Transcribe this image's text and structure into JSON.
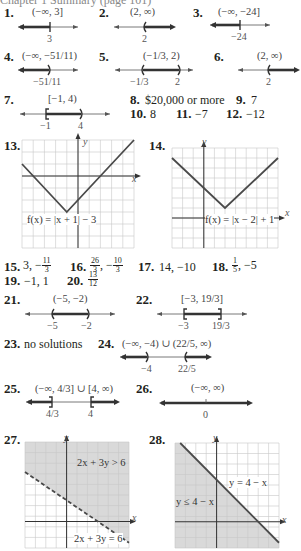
{
  "header": {
    "partial_text": "Chapter 1 Summary (page 101)"
  },
  "problems": [
    {
      "num": "1.",
      "interval": "(−∞, 3]",
      "points": [
        "3"
      ]
    },
    {
      "num": "2.",
      "interval": "(2, ∞)",
      "points": [
        "2"
      ]
    },
    {
      "num": "3.",
      "interval": "(−∞, −24]",
      "points": [
        "−24"
      ]
    },
    {
      "num": "4.",
      "interval": "(−∞, −51/11)",
      "points": [
        "−51/11"
      ]
    },
    {
      "num": "5.",
      "interval": "(−1/3, 2)",
      "points": [
        "−1/3",
        "2"
      ]
    },
    {
      "num": "6.",
      "interval": "(2, ∞)",
      "points": [
        "2"
      ]
    },
    {
      "num": "7.",
      "interval": "[−1, 4)",
      "points": [
        "−1",
        "4"
      ]
    },
    {
      "num": "8.",
      "answer": "$20,000 or more"
    },
    {
      "num": "9.",
      "answer": "7"
    },
    {
      "num": "10.",
      "answer": "8"
    },
    {
      "num": "11.",
      "answer": "−7"
    },
    {
      "num": "12.",
      "answer": "−12"
    },
    {
      "num": "13.",
      "graph_label": "f(x) = |x + 1| − 3",
      "axis_x": "x",
      "axis_y": "y"
    },
    {
      "num": "14.",
      "graph_label": "f(x) = |x − 2| + 1",
      "axis_x": "x",
      "axis_y": "y"
    },
    {
      "num": "15.",
      "answer_prefix": "3, −",
      "frac": {
        "n": "11",
        "d": "3"
      }
    },
    {
      "num": "16.",
      "frac1": {
        "n": "26",
        "d": "3"
      },
      "sep": ", −",
      "frac2": {
        "n": "10",
        "d": "3"
      }
    },
    {
      "num": "17.",
      "answer": "14, −10"
    },
    {
      "num": "18.",
      "frac": {
        "n": "1",
        "d": "5"
      },
      "answer_suffix": ", −5"
    },
    {
      "num": "19.",
      "answer": "−1, 1"
    },
    {
      "num": "20.",
      "frac": {
        "n": "13",
        "d": "12"
      }
    },
    {
      "num": "21.",
      "interval": "(−5, −2)",
      "points": [
        "−5",
        "−2"
      ]
    },
    {
      "num": "22.",
      "interval": "[−3, 19/3]",
      "points": [
        "−3",
        "19/3"
      ]
    },
    {
      "num": "23.",
      "answer": "no solutions"
    },
    {
      "num": "24.",
      "interval": "(−∞, −4) ∪ (22/5, ∞)",
      "points": [
        "−4",
        "22/5"
      ]
    },
    {
      "num": "25.",
      "interval": "(−∞, 4/3] ∪ [4, ∞)",
      "points": [
        "4/3",
        "4"
      ]
    },
    {
      "num": "26.",
      "interval": "(−∞, ∞)",
      "points": [
        "0"
      ]
    },
    {
      "num": "27.",
      "region_label": "2x + 3y > 6",
      "line_label": "2x + 3y = 6",
      "axis_x": "x",
      "axis_y": "y"
    },
    {
      "num": "28.",
      "region_label": "y ≤ 4 − x",
      "line_label": "y = 4 − x",
      "axis_x": "x",
      "axis_y": "y"
    }
  ],
  "colors": {
    "ink": "#231f20",
    "line": "#4a4a4a",
    "grid": "#c8c8c8",
    "shade": "#d9d9d9"
  }
}
